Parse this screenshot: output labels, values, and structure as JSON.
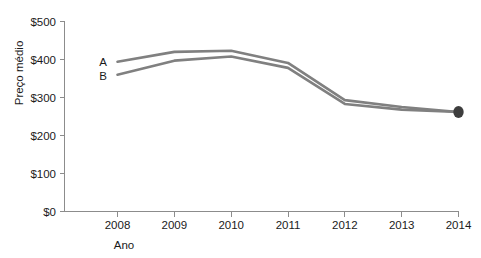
{
  "chart_data": {
    "type": "line",
    "title": "",
    "xlabel": "Ano",
    "ylabel": "Preço médio",
    "categories": [
      "2008",
      "2009",
      "2010",
      "2011",
      "2012",
      "2013",
      "2014"
    ],
    "x": [
      2008,
      2009,
      2010,
      2011,
      2012,
      2013,
      2014
    ],
    "series": [
      {
        "name": "A",
        "label": "A",
        "color": "#808080",
        "values": [
          394,
          420,
          423,
          391,
          293,
          275,
          262
        ]
      },
      {
        "name": "B",
        "label": "B",
        "color": "#808080",
        "values": [
          360,
          397,
          408,
          378,
          283,
          268,
          262
        ]
      }
    ],
    "ylim": [
      0,
      500
    ],
    "yticks": [
      0,
      100,
      200,
      300,
      400,
      500
    ],
    "ytick_labels": [
      "$0",
      "$100",
      "$200",
      "$300",
      "$400",
      "$500"
    ],
    "xtick_labels": [
      "2008",
      "2009",
      "2010",
      "2011",
      "2012",
      "2013",
      "2014"
    ],
    "grid": false,
    "legend": "inline-series-labels",
    "markers": [
      {
        "series": "A",
        "x": 2014,
        "y": 262,
        "color": "#3d3d3d",
        "shape": "ellipse"
      }
    ],
    "axis_color": "#8c8c8c",
    "line_color": "#808080",
    "marker_color": "#3d3d3d",
    "background": "#ffffff"
  },
  "axes": {
    "y_title": "Preço médio",
    "x_title": "Ano",
    "y_ticks": [
      {
        "label": "$500",
        "value": 500
      },
      {
        "label": "$400",
        "value": 400
      },
      {
        "label": "$300",
        "value": 300
      },
      {
        "label": "$200",
        "value": 200
      },
      {
        "label": "$100",
        "value": 100
      },
      {
        "label": "$0",
        "value": 0
      }
    ],
    "x_ticks": [
      {
        "label": "2008"
      },
      {
        "label": "2009"
      },
      {
        "label": "2010"
      },
      {
        "label": "2011"
      },
      {
        "label": "2012"
      },
      {
        "label": "2013"
      },
      {
        "label": "2014"
      }
    ]
  },
  "series_labels": {
    "a": "A",
    "b": "B"
  }
}
